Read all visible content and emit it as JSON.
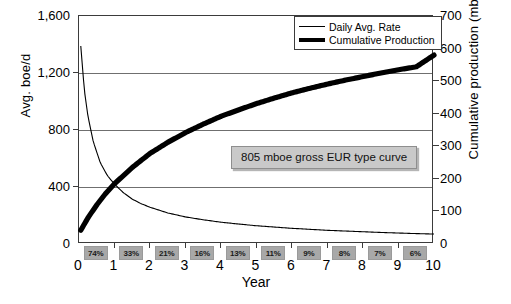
{
  "chart_data": {
    "type": "line",
    "title": "",
    "xlabel": "Year",
    "ylabel": "Avg. boe/d",
    "y2label": "Cumulative production (mboe)",
    "xlim": [
      0,
      10
    ],
    "ylim": [
      0,
      1600
    ],
    "y2lim": [
      0,
      700
    ],
    "grid": true,
    "legend_position": "top-right",
    "xticks": [
      "0",
      "1",
      "2",
      "3",
      "4",
      "5",
      "6",
      "7",
      "8",
      "9",
      "10"
    ],
    "yticks_left": [
      "0",
      "400",
      "800",
      "1,200",
      "1,600"
    ],
    "yticks_right": [
      "0",
      "100",
      "200",
      "300",
      "400",
      "500",
      "600",
      "700"
    ],
    "series": [
      {
        "name": "Daily Avg. Rate",
        "axis": "left",
        "unit": "boe/d",
        "style": "thin",
        "x": [
          0.05,
          0.15,
          0.25,
          0.4,
          0.6,
          0.8,
          1.0,
          1.25,
          1.5,
          1.75,
          2.0,
          2.5,
          3.0,
          3.5,
          4.0,
          4.5,
          5.0,
          5.5,
          6.0,
          6.5,
          7.0,
          7.5,
          8.0,
          8.5,
          9.0,
          9.5,
          10.0
        ],
        "values": [
          1390,
          1080,
          900,
          720,
          570,
          480,
          420,
          360,
          315,
          283,
          258,
          218,
          190,
          170,
          153,
          140,
          128,
          119,
          110,
          103,
          96,
          91,
          86,
          81,
          77,
          73,
          70
        ]
      },
      {
        "name": "Cumulative Production",
        "axis": "right",
        "unit": "mboe",
        "style": "thick",
        "x": [
          0.05,
          0.25,
          0.5,
          0.75,
          1.0,
          1.5,
          2.0,
          2.5,
          3.0,
          3.5,
          4.0,
          4.5,
          5.0,
          5.5,
          6.0,
          6.5,
          7.0,
          7.5,
          8.0,
          8.5,
          9.0,
          9.5,
          10.0
        ],
        "values": [
          42,
          80,
          120,
          155,
          185,
          235,
          278,
          312,
          342,
          368,
          392,
          412,
          431,
          448,
          464,
          478,
          491,
          503,
          514,
          525,
          535,
          544,
          580
        ]
      }
    ],
    "annotations": [
      {
        "text": "805 mboe gross EUR type curve",
        "x": 5.3,
        "y": 640
      }
    ],
    "decline_labels": {
      "caption": "annual decline rate by year",
      "values": [
        "74%",
        "33%",
        "21%",
        "16%",
        "13%",
        "11%",
        "9%",
        "8%",
        "7%",
        "6%"
      ]
    }
  },
  "colors": {
    "curve": "#000000",
    "grid": "#6f6f6f",
    "frame": "#3b3b3b",
    "pct_box_fill": "#a8a8a8",
    "annotation_fill": "#c9c9c9",
    "background": "#ffffff"
  }
}
